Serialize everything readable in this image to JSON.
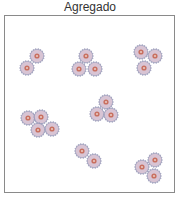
{
  "title": "Agregado",
  "colors": {
    "frame": "#8a8a8a",
    "gear_edge": "#9a9ab8",
    "body": "#d8c4d4",
    "core_ring": "#c87060",
    "core_center": "#e8c8c0"
  },
  "particle_radius": 8,
  "clusters": [
    {
      "name": "cluster-1",
      "particles": [
        [
          37,
          56
        ],
        [
          27,
          68
        ]
      ]
    },
    {
      "name": "cluster-2",
      "particles": [
        [
          86,
          56
        ],
        [
          79,
          69
        ],
        [
          95,
          69
        ]
      ]
    },
    {
      "name": "cluster-3",
      "particles": [
        [
          141,
          52
        ],
        [
          155,
          56
        ],
        [
          144,
          68
        ]
      ]
    },
    {
      "name": "cluster-4",
      "particles": [
        [
          28,
          118
        ],
        [
          41,
          117
        ],
        [
          38,
          130
        ],
        [
          52,
          129
        ]
      ]
    },
    {
      "name": "cluster-5",
      "particles": [
        [
          106,
          102
        ],
        [
          97,
          114
        ],
        [
          111,
          115
        ]
      ]
    },
    {
      "name": "cluster-6",
      "particles": [
        [
          82,
          151
        ],
        [
          94,
          161
        ]
      ]
    },
    {
      "name": "cluster-7",
      "particles": [
        [
          142,
          167
        ],
        [
          155,
          160
        ],
        [
          154,
          176
        ]
      ]
    }
  ]
}
